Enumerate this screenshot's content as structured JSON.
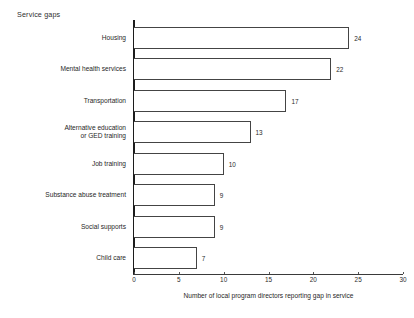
{
  "chart_data": {
    "type": "bar",
    "orientation": "horizontal",
    "title": "Service gaps",
    "xlabel": "Number of local program directors reporting gap in service",
    "ylabel": "",
    "xlim": [
      0,
      30
    ],
    "xticks": [
      0,
      5,
      10,
      15,
      20,
      25,
      30
    ],
    "xtick_labels": [
      "0",
      "5",
      "10",
      "15",
      "20",
      "25",
      "30"
    ],
    "grid": false,
    "legend": null,
    "categories": [
      "Housing",
      "Mental health services",
      "Transportation",
      "Alternative education\nor GED training",
      "Job training",
      "Substance abuse treatment",
      "Social supports",
      "Child care"
    ],
    "values": [
      24,
      22,
      17,
      13,
      10,
      9,
      9,
      7
    ],
    "data_labels": [
      "24",
      "22",
      "17",
      "13",
      "10",
      "9",
      "9",
      "7"
    ],
    "bar_fill_color": "#ffffff",
    "bar_edge_color": "#444444",
    "axis_color": "#1c1c1c"
  },
  "footnote": {
    "text": ""
  }
}
